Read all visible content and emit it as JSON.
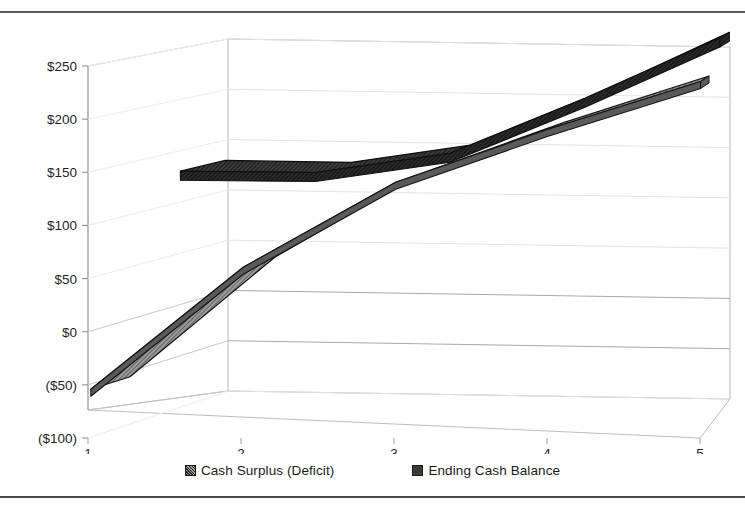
{
  "page": {
    "background": "#ffffff",
    "rule_color": "#4a4a4a"
  },
  "legend": {
    "position": "bottom-center",
    "items": [
      {
        "label": "Cash Surplus (Deficit)",
        "swatch": "gray-hatched",
        "color": "#8d8d8d"
      },
      {
        "label": "Ending Cash Balance",
        "swatch": "dark-solid",
        "color": "#3a3a3a"
      }
    ]
  },
  "chart_data": {
    "type": "line",
    "style": "3d-ribbon",
    "title": "",
    "subtitle": "",
    "xlabel": "",
    "ylabel": "",
    "x": [
      1,
      2,
      3,
      4,
      5
    ],
    "categories": [
      "1",
      "2",
      "3",
      "4",
      "5"
    ],
    "xtick_labels": [
      "1",
      "2",
      "3",
      "4",
      "5"
    ],
    "ytick_labels": [
      "$250",
      "$200",
      "$150",
      "$100",
      "$50",
      "$0",
      "($50)",
      "($100)"
    ],
    "ytick_values": [
      250,
      200,
      150,
      100,
      50,
      0,
      -50,
      -100
    ],
    "ylim": [
      -100,
      250
    ],
    "grid": true,
    "grid_axis": "y",
    "legend_position": "bottom",
    "series": [
      {
        "name": "Cash Surplus (Deficit)",
        "color": "#8d8d8d",
        "fill": "gray-hatched",
        "values": [
          -55,
          60,
          140,
          190,
          235
        ]
      },
      {
        "name": "Ending Cash Balance",
        "color": "#3a3a3a",
        "fill": "dark-solid",
        "values": [
          130,
          130,
          150,
          205,
          265
        ]
      }
    ]
  }
}
